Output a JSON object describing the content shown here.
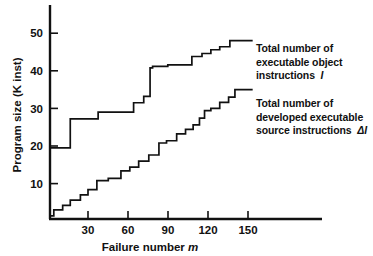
{
  "chart_data": {
    "type": "line",
    "title": "",
    "xlabel": "Failure number m",
    "ylabel": "Program size (K inst)",
    "xlim": [
      0,
      172
    ],
    "ylim": [
      0,
      57
    ],
    "xticks": [
      30,
      60,
      90,
      120,
      150
    ],
    "yticks": [
      10,
      20,
      30,
      40,
      50
    ],
    "grid": false,
    "legend_position": "inside-right-annotations",
    "step_style": "post",
    "series": [
      {
        "name": "Total number of executable object instructions I",
        "x": [
          0,
          2,
          16,
          16,
          38,
          38,
          66,
          66,
          74,
          74,
          79,
          79,
          81,
          81,
          93,
          93,
          112,
          112,
          120,
          120,
          127,
          127,
          134,
          134,
          142,
          142,
          160
        ],
        "y": [
          19.5,
          19.5,
          19.5,
          27.2,
          27.2,
          29.0,
          29.0,
          31.5,
          31.5,
          33.2,
          33.2,
          40.8,
          40.8,
          41.2,
          41.2,
          41.6,
          41.6,
          43.8,
          43.8,
          44.6,
          44.6,
          45.6,
          45.6,
          46.4,
          46.4,
          48.0,
          48.0
        ]
      },
      {
        "name": "Total number of developed executable source instructions ΔI",
        "x": [
          0,
          3,
          3,
          10,
          10,
          16,
          16,
          24,
          24,
          30,
          30,
          37,
          37,
          46,
          46,
          56,
          56,
          63,
          63,
          70,
          70,
          78,
          78,
          86,
          86,
          92,
          92,
          100,
          100,
          107,
          107,
          113,
          113,
          118,
          118,
          122,
          122,
          127,
          127,
          134,
          134,
          141,
          141,
          146,
          146,
          160
        ],
        "y": [
          1.4,
          1.4,
          3.0,
          3.0,
          4.2,
          4.2,
          5.6,
          5.6,
          7.0,
          7.0,
          8.4,
          8.4,
          10.8,
          10.8,
          11.4,
          11.4,
          13.4,
          13.4,
          14.4,
          14.4,
          16.0,
          16.0,
          17.6,
          17.6,
          20.8,
          20.8,
          21.4,
          21.4,
          23.2,
          23.2,
          24.4,
          24.4,
          25.6,
          25.6,
          27.4,
          27.4,
          29.4,
          29.4,
          30.0,
          30.0,
          31.6,
          31.6,
          33.0,
          33.0,
          35.0,
          35.0
        ]
      }
    ]
  },
  "axes": {
    "y_title": "Program size (K inst)",
    "x_title_main": "Failure number",
    "x_title_symbol": "m",
    "tick_labels_y": [
      "50",
      "40",
      "30",
      "20",
      "10"
    ],
    "tick_labels_x": [
      "30",
      "60",
      "90",
      "120",
      "150"
    ]
  },
  "annotations": {
    "object": {
      "line1": "Total number of",
      "line2": "executable object",
      "line3": "instructions",
      "symbol": "I"
    },
    "source": {
      "line1": "Total number of",
      "line2": "developed executable",
      "line3": "source instructions",
      "symbol": "ΔI"
    }
  },
  "colors": {
    "line": "#111111",
    "axis": "#111111",
    "background": "#ffffff"
  }
}
